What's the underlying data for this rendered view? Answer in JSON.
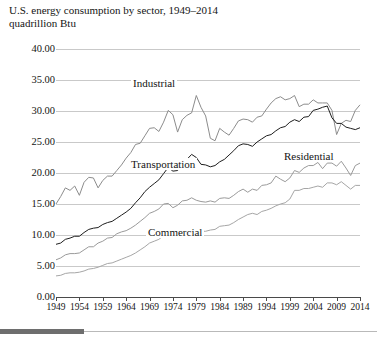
{
  "chart_data": {
    "type": "line",
    "title": "U.S. energy consumption by sector, 1949–2014",
    "subtitle": "quadrillion Btu",
    "xlabel": "",
    "ylabel": "",
    "ylim": [
      0,
      40
    ],
    "xlim": [
      1949,
      2014
    ],
    "ytick_labels": [
      "0.00",
      "5.00",
      "10.00",
      "15.00",
      "20.00",
      "25.00",
      "30.00",
      "35.00",
      "40.00"
    ],
    "ytick_values": [
      0,
      5,
      10,
      15,
      20,
      25,
      30,
      35,
      40
    ],
    "xtick_labels": [
      "1949",
      "1954",
      "1959",
      "1964",
      "1969",
      "1974",
      "1979",
      "1984",
      "1989",
      "1994",
      "1999",
      "2004",
      "2009",
      "2014"
    ],
    "xtick_values": [
      1949,
      1954,
      1959,
      1964,
      1969,
      1974,
      1979,
      1984,
      1989,
      1994,
      1999,
      2004,
      2009,
      2014
    ],
    "grid": true,
    "legend_position": "inline-annotations",
    "x": [
      1949,
      1950,
      1951,
      1952,
      1953,
      1954,
      1955,
      1956,
      1957,
      1958,
      1959,
      1960,
      1961,
      1962,
      1963,
      1964,
      1965,
      1966,
      1967,
      1968,
      1969,
      1970,
      1971,
      1972,
      1973,
      1974,
      1975,
      1976,
      1977,
      1978,
      1979,
      1980,
      1981,
      1982,
      1983,
      1984,
      1985,
      1986,
      1987,
      1988,
      1989,
      1990,
      1991,
      1992,
      1993,
      1994,
      1995,
      1996,
      1997,
      1998,
      1999,
      2000,
      2001,
      2002,
      2003,
      2004,
      2005,
      2006,
      2007,
      2008,
      2009,
      2010,
      2011,
      2012,
      2013,
      2014
    ],
    "series": [
      {
        "name": "Industrial",
        "color": "#8c8c8c",
        "values": [
          15.0,
          16.2,
          17.6,
          17.2,
          17.9,
          16.4,
          18.5,
          19.3,
          19.2,
          17.6,
          18.8,
          19.5,
          19.5,
          20.4,
          21.3,
          22.4,
          23.3,
          24.6,
          24.8,
          26.0,
          27.2,
          27.3,
          26.7,
          28.2,
          30.1,
          29.4,
          26.6,
          28.6,
          29.3,
          29.7,
          32.5,
          30.6,
          29.2,
          25.6,
          25.2,
          27.2,
          26.6,
          26.1,
          27.2,
          28.4,
          28.7,
          28.6,
          28.2,
          29.0,
          29.2,
          30.3,
          31.3,
          32.0,
          32.3,
          31.8,
          32.0,
          32.5,
          30.7,
          31.1,
          31.1,
          31.8,
          31.3,
          31.3,
          31.3,
          30.1,
          26.2,
          28.0,
          28.5,
          28.3,
          30.1,
          31.0
        ]
      },
      {
        "name": "Transportation",
        "color": "#1e1e1e",
        "values": [
          8.5,
          8.7,
          9.3,
          9.5,
          9.8,
          9.8,
          10.4,
          10.9,
          11.1,
          11.2,
          11.7,
          12.0,
          12.2,
          12.7,
          13.2,
          13.7,
          14.3,
          15.2,
          16.0,
          17.0,
          17.7,
          18.3,
          18.9,
          19.9,
          20.9,
          20.3,
          20.4,
          21.4,
          22.2,
          23.0,
          22.5,
          21.4,
          21.3,
          21.0,
          21.2,
          21.8,
          22.2,
          22.9,
          23.6,
          24.4,
          24.7,
          24.6,
          24.3,
          25.0,
          25.5,
          26.0,
          26.2,
          26.8,
          27.3,
          27.5,
          28.2,
          28.6,
          28.3,
          29.0,
          29.1,
          30.1,
          30.3,
          30.6,
          30.8,
          28.9,
          28.0,
          28.0,
          27.4,
          27.2,
          27.0,
          27.3
        ]
      },
      {
        "name": "Residential",
        "color": "#9a9a9a",
        "values": [
          6.0,
          6.3,
          6.8,
          7.0,
          7.0,
          7.1,
          7.6,
          8.1,
          8.1,
          8.7,
          9.0,
          9.5,
          9.6,
          10.2,
          10.5,
          10.7,
          11.1,
          11.6,
          12.2,
          12.8,
          13.5,
          13.8,
          14.2,
          15.0,
          15.1,
          14.4,
          14.8,
          15.5,
          15.6,
          16.0,
          15.6,
          15.4,
          15.3,
          15.5,
          15.3,
          15.9,
          16.0,
          15.9,
          16.4,
          17.0,
          17.4,
          16.9,
          17.4,
          17.2,
          18.0,
          18.1,
          18.4,
          19.5,
          19.0,
          18.6,
          19.2,
          20.4,
          20.1,
          20.8,
          21.2,
          21.2,
          21.7,
          20.7,
          21.6,
          21.6,
          21.1,
          21.9,
          20.8,
          19.6,
          21.2,
          21.6
        ]
      },
      {
        "name": "Commercial",
        "color": "#a6a6a6",
        "values": [
          3.4,
          3.5,
          3.8,
          3.9,
          3.9,
          4.0,
          4.2,
          4.5,
          4.6,
          4.8,
          5.1,
          5.4,
          5.5,
          5.8,
          6.1,
          6.4,
          6.7,
          7.1,
          7.6,
          8.1,
          8.7,
          9.0,
          9.3,
          9.9,
          10.2,
          10.0,
          10.0,
          10.4,
          10.7,
          11.0,
          10.9,
          10.6,
          10.6,
          10.8,
          10.9,
          11.4,
          11.5,
          11.6,
          12.0,
          12.5,
          12.9,
          13.3,
          13.5,
          13.3,
          13.8,
          14.0,
          14.3,
          14.7,
          15.0,
          15.2,
          15.8,
          17.2,
          17.2,
          17.5,
          17.5,
          17.7,
          17.9,
          17.7,
          18.4,
          18.4,
          18.1,
          18.6,
          18.0,
          17.4,
          18.0,
          18.0
        ]
      }
    ],
    "annotations": [
      {
        "text": "Industrial",
        "x_px": 131,
        "y_px": 77
      },
      {
        "text": "Transportation",
        "x_px": 129,
        "y_px": 158
      },
      {
        "text": "Residential",
        "x_px": 282,
        "y_px": 150
      },
      {
        "text": "Commercial",
        "x_px": 146,
        "y_px": 226
      }
    ]
  }
}
